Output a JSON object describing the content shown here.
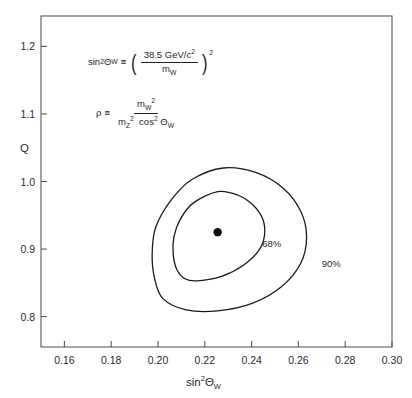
{
  "figure": {
    "name": "electroweak-rho-sin2theta-confidence-contours",
    "background_color": "#ffffff",
    "frame_color": "#5a5a5a",
    "curve_color": "#1a1a1a"
  },
  "annotations": {
    "formula1": {
      "lhs_base": "sin",
      "lhs_exp": "2",
      "lhs_theta": "Θ",
      "lhs_sub": "W",
      "equiv": "≡",
      "numerator": "38.5  GeV/c",
      "numerator_exp": "2",
      "denominator_base": "m",
      "denominator_sub": "W",
      "outer_exp": "2"
    },
    "formula2": {
      "lhs_symbol": "ρ",
      "equiv": "≡",
      "numerator_base": "m",
      "numerator_sub": "W",
      "numerator_exp": "2",
      "denominator_m": "m",
      "denominator_m_sub": "Z",
      "denominator_m_exp": "2",
      "denominator_cos": "cos",
      "denominator_cos_exp": "2",
      "denominator_theta": "Θ",
      "denominator_theta_sub": "W"
    }
  },
  "chart_data": {
    "type": "line",
    "title": "",
    "xlabel_base": "sin",
    "xlabel_exp": "2",
    "xlabel_theta": "Θ",
    "xlabel_sub": "W",
    "ylabel": "Q",
    "xlim": [
      0.15,
      0.3
    ],
    "ylim": [
      0.755,
      1.245
    ],
    "grid": false,
    "legend_position": "inline-curve-labels",
    "xticks": [
      0.16,
      0.18,
      0.2,
      0.22,
      0.24,
      0.26,
      0.28,
      0.3
    ],
    "xtick_labels": [
      "0.16",
      "0.18",
      "0.20",
      "0.22",
      "0.24",
      "0.26",
      "0.28",
      "0.30"
    ],
    "yticks": [
      0.8,
      0.9,
      1.0,
      1.1,
      1.2
    ],
    "ytick_labels": [
      "0.8",
      "0.9",
      "1.0",
      "1.1",
      "1.2"
    ],
    "best_fit_point": {
      "name": "best-fit",
      "x": 0.2255,
      "y": 0.925,
      "marker": "filled-circle",
      "marker_radius_px": 4.2
    },
    "series": [
      {
        "name": "68% confidence contour",
        "label": "68%",
        "label_x": 0.2445,
        "label_y": 0.9025,
        "x_range": [
          0.2065,
          0.2455
        ],
        "y_range": [
          0.853,
          0.985
        ],
        "points": [
          {
            "x": 0.2255,
            "y": 0.985
          },
          {
            "x": 0.234,
            "y": 0.98
          },
          {
            "x": 0.2405,
            "y": 0.9655
          },
          {
            "x": 0.2448,
            "y": 0.944
          },
          {
            "x": 0.2455,
            "y": 0.92
          },
          {
            "x": 0.243,
            "y": 0.8975
          },
          {
            "x": 0.2365,
            "y": 0.876
          },
          {
            "x": 0.2275,
            "y": 0.86
          },
          {
            "x": 0.217,
            "y": 0.853
          },
          {
            "x": 0.2115,
            "y": 0.856
          },
          {
            "x": 0.208,
            "y": 0.87
          },
          {
            "x": 0.2065,
            "y": 0.8925
          },
          {
            "x": 0.2068,
            "y": 0.918
          },
          {
            "x": 0.2095,
            "y": 0.944
          },
          {
            "x": 0.215,
            "y": 0.968
          },
          {
            "x": 0.2255,
            "y": 0.985
          }
        ]
      },
      {
        "name": "90% confidence contour",
        "label": "90%",
        "label_x": 0.27,
        "label_y": 0.8735,
        "x_range": [
          0.1975,
          0.2635
        ],
        "y_range": [
          0.808,
          1.02
        ],
        "points": [
          {
            "x": 0.228,
            "y": 1.02
          },
          {
            "x": 0.242,
            "y": 1.013
          },
          {
            "x": 0.2535,
            "y": 0.99
          },
          {
            "x": 0.261,
            "y": 0.956
          },
          {
            "x": 0.2635,
            "y": 0.918
          },
          {
            "x": 0.261,
            "y": 0.879
          },
          {
            "x": 0.253,
            "y": 0.845
          },
          {
            "x": 0.2405,
            "y": 0.82
          },
          {
            "x": 0.2255,
            "y": 0.8085
          },
          {
            "x": 0.212,
            "y": 0.81
          },
          {
            "x": 0.202,
            "y": 0.827
          },
          {
            "x": 0.1985,
            "y": 0.857
          },
          {
            "x": 0.1975,
            "y": 0.893
          },
          {
            "x": 0.199,
            "y": 0.932
          },
          {
            "x": 0.2055,
            "y": 0.972
          },
          {
            "x": 0.2145,
            "y": 1.003
          },
          {
            "x": 0.228,
            "y": 1.02
          }
        ]
      }
    ]
  }
}
